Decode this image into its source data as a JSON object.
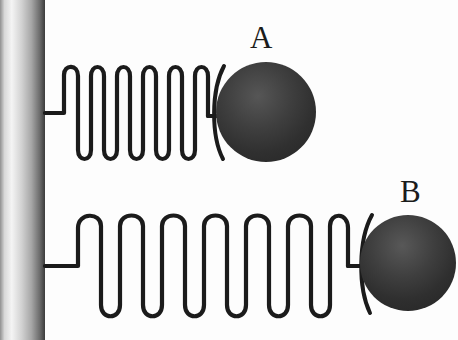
{
  "figure": {
    "background_color": "#fdfdfd",
    "stroke_color": "#1b1b1b",
    "labels": {
      "mass_a": "A",
      "mass_b": "B"
    },
    "wall": {
      "name": "wall",
      "x": 0,
      "y": 0,
      "width": 45,
      "height": 340,
      "gradient_stops": [
        "#8d8d8d",
        "#f2f2f2",
        "#bdbdbd",
        "#6e6e6e",
        "#3a3a3a"
      ]
    },
    "systems": [
      {
        "id": "system-a",
        "label": "A",
        "spring": {
          "name": "spring-a",
          "coils": 6,
          "state": "compressed",
          "start_x": 45,
          "end_x": 222,
          "axis_y": 113,
          "coil_top_y": 68,
          "coil_bottom_y": 160,
          "coil_width": 26,
          "stroke_width": 4
        },
        "mass": {
          "name": "mass-a",
          "shape": "circle",
          "center_x": 266,
          "center_y": 112,
          "radius": 50,
          "fill_color": "#3b3b3b",
          "fill_highlight": "#565656"
        }
      },
      {
        "id": "system-b",
        "label": "B",
        "spring": {
          "name": "spring-b",
          "coils": 7,
          "state": "stretched",
          "start_x": 45,
          "end_x": 372,
          "axis_y": 266,
          "coil_top_y": 216,
          "coil_bottom_y": 320,
          "coil_width": 42,
          "stroke_width": 4
        },
        "mass": {
          "name": "mass-b",
          "shape": "circle",
          "center_x": 408,
          "center_y": 263,
          "radius": 48,
          "fill_color": "#3b3b3b",
          "fill_highlight": "#565656"
        }
      }
    ]
  }
}
